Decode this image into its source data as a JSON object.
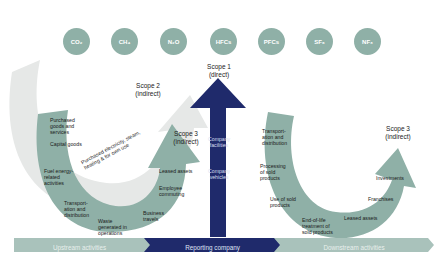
{
  "gases": [
    {
      "label": "CO₂",
      "x": 63
    },
    {
      "label": "CH₄",
      "x": 111
    },
    {
      "label": "N₂O",
      "x": 160
    },
    {
      "label": "HFCs",
      "x": 210
    },
    {
      "label": "PFCs",
      "x": 258
    },
    {
      "label": "SF₆",
      "x": 306
    },
    {
      "label": "NF₃",
      "x": 354
    }
  ],
  "scopes": {
    "scope1": {
      "line1": "Scope 1",
      "line2": "(direct)"
    },
    "scope2": {
      "line1": "Scope 2",
      "line2": "(indirect)"
    },
    "scope3_upstream": {
      "line1": "Scope 3",
      "line2": "(indirect)"
    },
    "scope3_downstream": {
      "line1": "Scope 3",
      "line2": "(indirect)"
    }
  },
  "scope2_arrow_label": "Purchased electricity, steam, heating & for own use",
  "upstream_items": [
    "Purchased goods and services",
    "Capital goods",
    "Fuel energy-related activities",
    "Transport-ation and distribution",
    "Waste generated in operations",
    "Business travels",
    "Employee commuting",
    "Leased assets"
  ],
  "company_items": [
    "Company facilities",
    "Company vehicles"
  ],
  "downstream_items": [
    "Transport-ation and distribution",
    "Processing of sold products",
    "Use of sold products",
    "End-of-life treatment of sold products",
    "Leased assets",
    "Franchises",
    "Investments"
  ],
  "bottom_bar": {
    "upstream": "Upstream activities",
    "reporting": "Reporting company",
    "downstream": "Downstream activities"
  },
  "colors": {
    "gas_circle": "#8fb0a7",
    "scope3_green": "#8fb0a7",
    "scope2_grey": "#e6e8e7",
    "scope1_navy": "#1f2a6b",
    "bar_green": "#a9c2bb"
  }
}
